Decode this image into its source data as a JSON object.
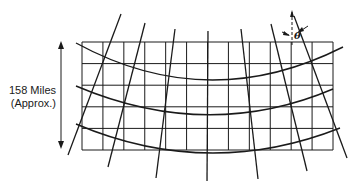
{
  "figure": {
    "dimension_label_line1": "158 Miles",
    "dimension_label_line2": "(Approx.)",
    "angle_symbol": "θ",
    "grid": {
      "left": 82,
      "right": 333,
      "top": 42,
      "bottom": 150,
      "columns": 12,
      "rows": 5
    },
    "colors": {
      "line": "#1a1a1a",
      "background": "#ffffff"
    }
  }
}
